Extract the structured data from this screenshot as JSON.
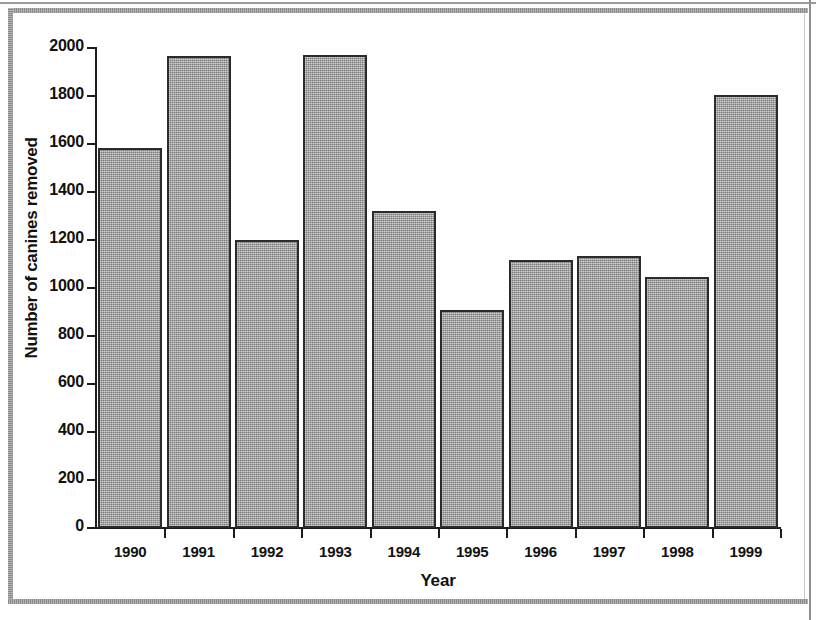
{
  "chart_data": {
    "type": "bar",
    "title": "",
    "xlabel": "Year",
    "ylabel": "Number of canines removed",
    "categories": [
      "1990",
      "1991",
      "1992",
      "1993",
      "1994",
      "1995",
      "1996",
      "1997",
      "1998",
      "1999"
    ],
    "values": [
      1585,
      1965,
      1200,
      1970,
      1320,
      910,
      1115,
      1135,
      1045,
      1805
    ],
    "ylim": [
      0,
      2000
    ],
    "yticks": [
      0,
      200,
      400,
      600,
      800,
      1000,
      1200,
      1400,
      1600,
      1800,
      2000
    ],
    "ytick_labels": [
      "0",
      "200",
      "400",
      "600",
      "800",
      "1000",
      "1200",
      "1400",
      "1600",
      "1800",
      "2000"
    ],
    "grid": false,
    "legend": "none",
    "bar_color": "#9c9c9c",
    "bar_edge_color": "#2b2b2b",
    "axis_color": "#1c1c1c"
  },
  "figure": {
    "background": "#ffffff",
    "border_color": "#8d8d8d"
  }
}
